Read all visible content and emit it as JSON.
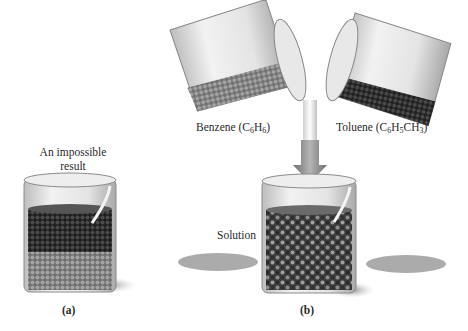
{
  "figure": {
    "panel_a": {
      "caption_line1": "An impossible",
      "caption_line2": "result",
      "panel_label": "(a)"
    },
    "panel_b": {
      "benzene": {
        "name": "Benzene (C",
        "sub1": "6",
        "mid": "H",
        "sub2": "6",
        "end": ")"
      },
      "toluene": {
        "name": "Toluene (C",
        "sub1": "6",
        "mid1": "H",
        "sub2": "5",
        "mid2": "CH",
        "sub3": "3",
        "end": ")"
      },
      "solution_label": "Solution",
      "panel_label": "(b)"
    },
    "colors": {
      "benzene_particles": "#8a8a8a",
      "toluene_particles": "#3a3a3a",
      "glass": "#c9c9c9",
      "shadow": "#9a9a9a",
      "arrow": "#8c8c8c"
    }
  }
}
